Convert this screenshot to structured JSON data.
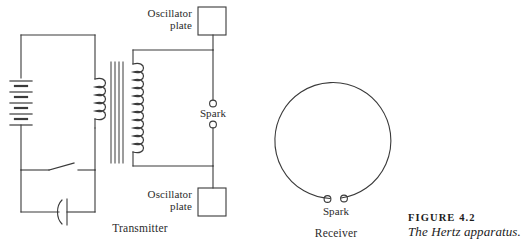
{
  "figure": {
    "number_label": "FIGURE 4.2",
    "caption": "The Hertz apparatus.",
    "stroke_color": "#3a3a3a",
    "text_color": "#2b2b2b",
    "background_color": "#ffffff"
  },
  "transmitter": {
    "section_label": "Transmitter",
    "top_plate_label_line1": "Oscillator",
    "top_plate_label_line2": "plate",
    "bottom_plate_label_line1": "Oscillator",
    "bottom_plate_label_line2": "plate",
    "spark_label": "Spark",
    "components": {
      "battery": "battery-4-cell",
      "switch": "knife-switch-open",
      "capacitor": "capacitor-curved-plate",
      "primary_coil_turns": 5,
      "core_lines": 4,
      "secondary_coil_turns": 11
    }
  },
  "receiver": {
    "section_label": "Receiver",
    "spark_label": "Spark",
    "shape": "open-loop-circle",
    "gap_terminals": 2
  }
}
